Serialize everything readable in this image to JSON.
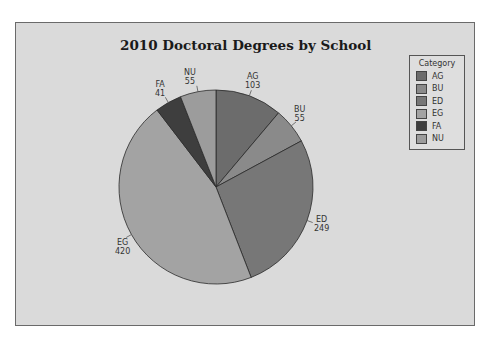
{
  "chart_data": {
    "type": "pie",
    "title": "2010 Doctoral Degrees by School",
    "categories": [
      "AG",
      "BU",
      "ED",
      "EG",
      "FA",
      "NU"
    ],
    "values": [
      103,
      55,
      249,
      420,
      41,
      55
    ],
    "colors": [
      "#6c6c6c",
      "#8a8a8a",
      "#777777",
      "#a3a3a3",
      "#3e3e3e",
      "#9c9c9c"
    ],
    "legend_title": "Category",
    "legend_position": "right",
    "start_angle": "12 o'clock",
    "direction": "clockwise"
  },
  "labels": {
    "AG": {
      "name": "AG",
      "value": "103"
    },
    "BU": {
      "name": "BU",
      "value": "55"
    },
    "ED": {
      "name": "ED",
      "value": "249"
    },
    "EG": {
      "name": "EG",
      "value": "420"
    },
    "FA": {
      "name": "FA",
      "value": "41"
    },
    "NU": {
      "name": "NU",
      "value": "55"
    }
  },
  "legend": {
    "title": "Category",
    "items": [
      {
        "label": "AG",
        "color": "#6c6c6c"
      },
      {
        "label": "BU",
        "color": "#8a8a8a"
      },
      {
        "label": "ED",
        "color": "#777777"
      },
      {
        "label": "EG",
        "color": "#a3a3a3"
      },
      {
        "label": "FA",
        "color": "#3e3e3e"
      },
      {
        "label": "NU",
        "color": "#9c9c9c"
      }
    ]
  }
}
